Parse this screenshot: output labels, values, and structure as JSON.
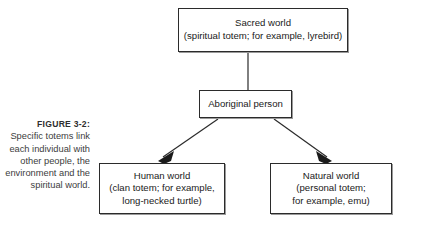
{
  "figure": {
    "caption_label": "FIGURE 3-2:",
    "caption_body": "Specific totems link each individual with other people, the environment and the spiritual world."
  },
  "nodes": {
    "sacred": {
      "line1": "Sacred world",
      "line2": "(spiritual totem; for example, lyrebird)"
    },
    "person": {
      "line1": "Aboriginal person"
    },
    "human": {
      "line1": "Human world",
      "line2": "(clan totem; for example,",
      "line3": "long-necked turtle)"
    },
    "natural": {
      "line1": "Natural world",
      "line2": "(personal totem;",
      "line3": "for example, emu)"
    }
  },
  "colors": {
    "background": "#ffffff",
    "box_border": "#2b2b2b",
    "box_shadow": "#9a9a9a",
    "text": "#1a1a1a",
    "caption_text": "#3d3d3d",
    "connector": "#2b2b2b"
  },
  "connectors": [
    {
      "name": "sacred-to-person",
      "from": "sacred",
      "to": "person",
      "style": "plain-line"
    },
    {
      "name": "person-to-human",
      "from": "person",
      "to": "human",
      "style": "arrow"
    },
    {
      "name": "person-to-natural",
      "from": "person",
      "to": "natural",
      "style": "arrow"
    }
  ]
}
